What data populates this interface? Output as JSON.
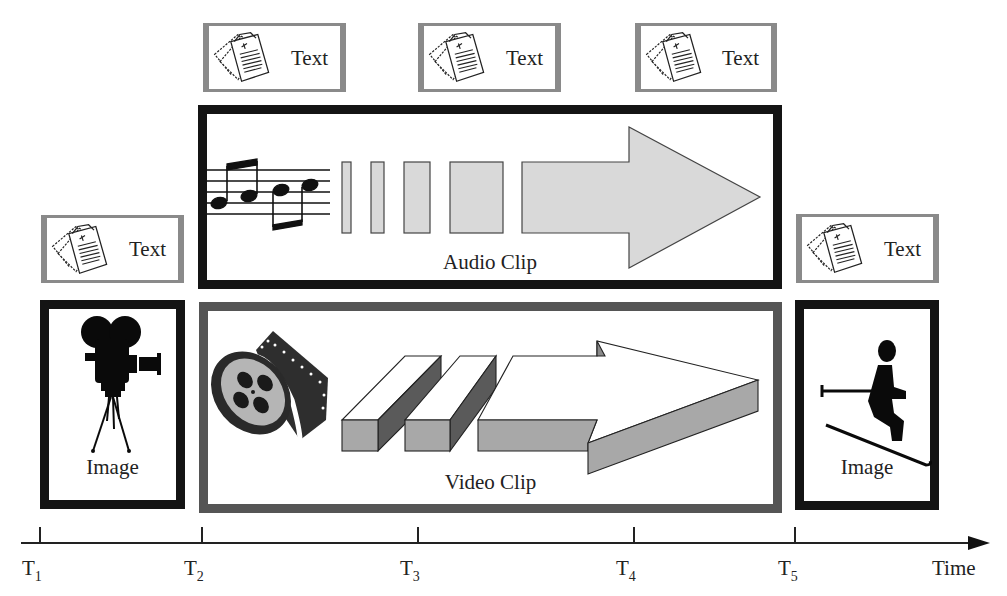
{
  "diagram": {
    "type": "multimedia-timeline",
    "text_boxes": [
      {
        "id": "text-1",
        "label": "Text",
        "icon": "documents-icon"
      },
      {
        "id": "text-2",
        "label": "Text",
        "icon": "documents-icon"
      },
      {
        "id": "text-3",
        "label": "Text",
        "icon": "documents-icon"
      },
      {
        "id": "text-4",
        "label": "Text",
        "icon": "documents-icon"
      },
      {
        "id": "text-5",
        "label": "Text",
        "icon": "documents-icon"
      }
    ],
    "image_boxes": [
      {
        "id": "image-1",
        "label": "Image",
        "icon": "movie-camera-icon"
      },
      {
        "id": "image-2",
        "label": "Image",
        "icon": "skier-icon"
      }
    ],
    "audio_clip": {
      "label": "Audio Clip",
      "icon": "music-notes-icon"
    },
    "video_clip": {
      "label": "Video Clip",
      "icon": "film-reel-icon"
    },
    "timeline": {
      "axis_label": "Time",
      "ticks": [
        {
          "base": "T",
          "sub": "1"
        },
        {
          "base": "T",
          "sub": "2"
        },
        {
          "base": "T",
          "sub": "3"
        },
        {
          "base": "T",
          "sub": "4"
        },
        {
          "base": "T",
          "sub": "5"
        }
      ]
    },
    "colors": {
      "box_border_black": "#141414",
      "box_border_gray": "#555555",
      "text_box_border": "#8a8a8a",
      "audio_fill": "#d9d9d9",
      "video_side_fill": "#a8a8a8",
      "video_dark_fill": "#5a5a5a"
    }
  }
}
